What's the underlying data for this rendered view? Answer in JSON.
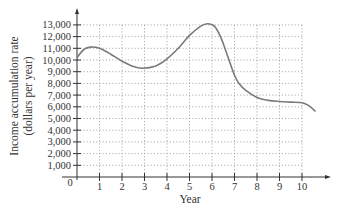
{
  "chart_data": {
    "type": "line",
    "title": "",
    "xlabel": "Year",
    "ylabel": "Income accumulation rate (dollars per year)",
    "ylabel_lines": [
      "Income accumulation rate",
      "(dollars per year)"
    ],
    "xlim": [
      0,
      11
    ],
    "ylim": [
      0,
      14000
    ],
    "x_ticks": [
      1,
      2,
      3,
      4,
      5,
      6,
      7,
      8,
      9,
      10
    ],
    "x_tick_labels": [
      "1",
      "2",
      "3",
      "4",
      "5",
      "6",
      "7",
      "8",
      "9",
      "10"
    ],
    "y_ticks": [
      1000,
      2000,
      3000,
      4000,
      5000,
      6000,
      7000,
      8000,
      9000,
      10000,
      11000,
      12000,
      13000
    ],
    "y_tick_labels": [
      "1,000",
      "2,000",
      "3,000",
      "4,000",
      "5,000",
      "6,000",
      "7,000",
      "8,000",
      "9,000",
      "10,000",
      "11,000",
      "12,000",
      "13,000"
    ],
    "origin_label": "0",
    "grid": true,
    "grid_style": "dotted",
    "legend": null,
    "series": [
      {
        "name": "Income accumulation rate",
        "color": "#7a7a7a",
        "x": [
          0,
          0.3,
          0.6,
          1.0,
          1.5,
          2.0,
          2.5,
          2.9,
          3.5,
          4.0,
          4.5,
          5.0,
          5.5,
          5.8,
          6.1,
          6.4,
          6.7,
          7.0,
          7.2,
          7.5,
          8.0,
          8.5,
          9.0,
          9.5,
          10.0,
          10.3,
          10.6
        ],
        "y": [
          10200,
          10900,
          11100,
          11000,
          10500,
          9900,
          9450,
          9300,
          9500,
          10100,
          11000,
          12100,
          12900,
          13100,
          12900,
          11900,
          10300,
          8700,
          8000,
          7400,
          6800,
          6550,
          6450,
          6400,
          6350,
          6100,
          5600
        ]
      }
    ]
  }
}
